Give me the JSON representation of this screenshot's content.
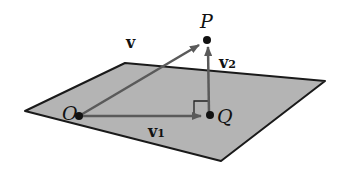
{
  "figure": {
    "points": {
      "P": "P",
      "O": "O",
      "Q": "Q"
    },
    "vectors": {
      "v": "v",
      "v1": "v",
      "v1_sub": "1",
      "v2": "v",
      "v2_sub": "2"
    },
    "colors": {
      "plane": "#b4b4b4",
      "plane_edge": "#1a1a1a",
      "vector": "#5a5a5a",
      "point": "#111111"
    }
  }
}
